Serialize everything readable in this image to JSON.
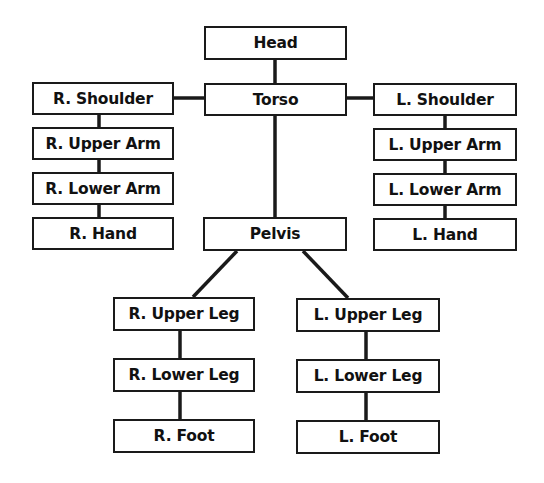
{
  "diagram": {
    "type": "hierarchy",
    "colors": {
      "stroke": "#1a1a1a",
      "text": "#111111",
      "background": "#ffffff"
    },
    "nodes": {
      "head": {
        "label": "Head"
      },
      "torso": {
        "label": "Torso"
      },
      "r_shoulder": {
        "label": "R. Shoulder"
      },
      "r_upper_arm": {
        "label": "R. Upper Arm"
      },
      "r_lower_arm": {
        "label": "R. Lower Arm"
      },
      "r_hand": {
        "label": "R. Hand"
      },
      "l_shoulder": {
        "label": "L. Shoulder"
      },
      "l_upper_arm": {
        "label": "L. Upper Arm"
      },
      "l_lower_arm": {
        "label": "L. Lower Arm"
      },
      "l_hand": {
        "label": "L. Hand"
      },
      "pelvis": {
        "label": "Pelvis"
      },
      "r_upper_leg": {
        "label": "R. Upper Leg"
      },
      "r_lower_leg": {
        "label": "R. Lower Leg"
      },
      "r_foot": {
        "label": "R. Foot"
      },
      "l_upper_leg": {
        "label": "L. Upper Leg"
      },
      "l_lower_leg": {
        "label": "L. Lower Leg"
      },
      "l_foot": {
        "label": "L. Foot"
      }
    },
    "edges": [
      [
        "Head",
        "Torso"
      ],
      [
        "Torso",
        "R. Shoulder"
      ],
      [
        "Torso",
        "L. Shoulder"
      ],
      [
        "R. Shoulder",
        "R. Upper Arm"
      ],
      [
        "R. Upper Arm",
        "R. Lower Arm"
      ],
      [
        "R. Lower Arm",
        "R. Hand"
      ],
      [
        "L. Shoulder",
        "L. Upper Arm"
      ],
      [
        "L. Upper Arm",
        "L. Lower Arm"
      ],
      [
        "L. Lower Arm",
        "L. Hand"
      ],
      [
        "Torso",
        "Pelvis"
      ],
      [
        "Pelvis",
        "R. Upper Leg"
      ],
      [
        "Pelvis",
        "L. Upper Leg"
      ],
      [
        "R. Upper Leg",
        "R. Lower Leg"
      ],
      [
        "R. Lower Leg",
        "R. Foot"
      ],
      [
        "L. Upper Leg",
        "L. Lower Leg"
      ],
      [
        "L. Lower Leg",
        "L. Foot"
      ]
    ]
  }
}
